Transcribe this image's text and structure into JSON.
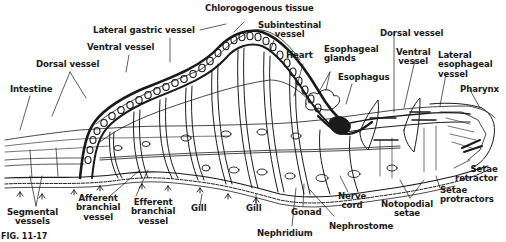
{
  "figure": {
    "caption": "FIG. 11-17",
    "colors": {
      "ink": "#1a1a1a",
      "background": "#ffffff"
    }
  },
  "labels": {
    "chlorogogenous_tissue": "Chlorogogenous tissue",
    "lateral_gastric_vessel": "Lateral gastric vessel",
    "subintestinal_vessel_1": "Subintestinal",
    "subintestinal_vessel_2": "vessel",
    "ventral_vessel_left": "Ventral vessel",
    "dorsal_vessel_left": "Dorsal vessel",
    "intestine": "Intestine",
    "heart": "Heart",
    "esophageal_glands_1": "Esophageal",
    "esophageal_glands_2": "glands",
    "esophagus": "Esophagus",
    "dorsal_vessel_right": "Dorsal vessel",
    "ventral_vessel_right_1": "Ventral",
    "ventral_vessel_right_2": "vessel",
    "lateral_esophageal_vessel_1": "Lateral",
    "lateral_esophageal_vessel_2": "esophageal",
    "lateral_esophageal_vessel_3": "vessel",
    "pharynx": "Pharynx",
    "setae_retractor_1": "Setae",
    "setae_retractor_2": "retractor",
    "setae_protractors_1": "Setae",
    "setae_protractors_2": "protractors",
    "notopodial_setae_1": "Notopodial",
    "notopodial_setae_2": "setae",
    "nerve_cord_1": "Nerve",
    "nerve_cord_2": "cord",
    "nephrostome": "Nephrostome",
    "gonad": "Gonad",
    "nephridium": "Nephridium",
    "gill_right": "Gill",
    "gill_left": "Gill",
    "efferent_branchial_vessel_1": "Efferent",
    "efferent_branchial_vessel_2": "branchial",
    "efferent_branchial_vessel_3": "vessel",
    "afferent_branchial_vessel_1": "Afferent",
    "afferent_branchial_vessel_2": "branchial",
    "afferent_branchial_vessel_3": "vessel",
    "segmental_vessels_1": "Segmental",
    "segmental_vessels_2": "vessels"
  }
}
